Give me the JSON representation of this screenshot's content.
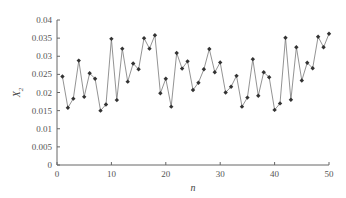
{
  "chart_data": {
    "type": "line",
    "title": "",
    "xlabel": "n",
    "ylabel": "X2",
    "ylabel_main": "X",
    "ylabel_sub": "2",
    "xlim": [
      0,
      50
    ],
    "ylim": [
      0,
      0.04
    ],
    "grid": false,
    "legend": null,
    "xticks": [
      0,
      10,
      20,
      30,
      40,
      50
    ],
    "yticks": [
      0,
      0.005,
      0.01,
      0.015,
      0.02,
      0.025,
      0.03,
      0.035,
      0.04
    ],
    "ytick_labels": [
      "0",
      "0.005",
      "0.01",
      "0.015",
      "0.02",
      "0.025",
      "0.03",
      "0.035",
      "0.04"
    ],
    "series": [
      {
        "name": "X2",
        "marker": "diamond",
        "color": "#333333",
        "x": [
          1,
          2,
          3,
          4,
          5,
          6,
          7,
          8,
          9,
          10,
          11,
          12,
          13,
          14,
          15,
          16,
          17,
          18,
          19,
          20,
          21,
          22,
          23,
          24,
          25,
          26,
          27,
          28,
          29,
          30,
          31,
          32,
          33,
          34,
          35,
          36,
          37,
          38,
          39,
          40,
          41,
          42,
          43,
          44,
          45,
          46,
          47,
          48,
          49,
          50
        ],
        "values": [
          0.0244,
          0.0158,
          0.0183,
          0.0288,
          0.0188,
          0.0253,
          0.0238,
          0.015,
          0.0167,
          0.0348,
          0.0179,
          0.0321,
          0.023,
          0.028,
          0.0264,
          0.035,
          0.0321,
          0.0358,
          0.0198,
          0.0238,
          0.0161,
          0.0309,
          0.0266,
          0.0286,
          0.0207,
          0.0227,
          0.0264,
          0.032,
          0.0256,
          0.0283,
          0.02,
          0.0216,
          0.0246,
          0.0161,
          0.0186,
          0.0292,
          0.0191,
          0.0256,
          0.0242,
          0.0152,
          0.017,
          0.0351,
          0.018,
          0.0325,
          0.0233,
          0.0282,
          0.0267,
          0.0354,
          0.0325,
          0.0362
        ]
      }
    ]
  }
}
